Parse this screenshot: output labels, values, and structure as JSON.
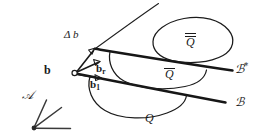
{
  "figure": {
    "type": "hand-drawn mathematical diagram",
    "background_color": "#ffffff",
    "ink_color": "#1a1a1a",
    "width": 269,
    "height": 140,
    "labels": {
      "delta_b": "Δ b",
      "b": "b",
      "b_r_base": "b",
      "b_r_sub": "r",
      "b_1_base": "b",
      "b_1_sub": "1",
      "b_star_base": "ℬ",
      "b_star_sup": "*",
      "b_cal": "ℬ",
      "q_doublebar": "Q",
      "q_bar": "Q",
      "q_plain": "Q",
      "a_cal": "𝒜"
    },
    "strokes": {
      "thin_upper_ray": "from vertex (95,48) up-right to (158,3)",
      "thick_line_b_star": "from vertex (95,48) down-right to (232,70)",
      "thick_line_b": "from vertex (75,73) down-right to (225,102)",
      "vector_delta_b": "from b (75,73) up-right to arrowhead at (95,48)",
      "vector_b_r": "from b (75,73) right to arrowhead at (100,61)",
      "vector_b_1": "from b (75,73) right-down to arrowhead at (101,77)",
      "blob_q_doublebar": "closed teardrop region upper-right",
      "arc_q_bar": "open arc region middle",
      "arc_q": "open arc region lower",
      "frame_a": "origin dot at (34,128) with three axis lines"
    }
  }
}
